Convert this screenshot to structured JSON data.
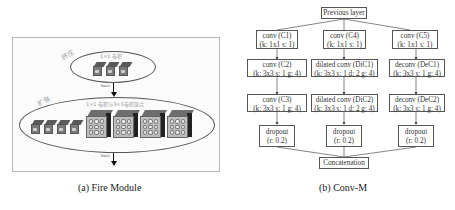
{
  "fire_module": {
    "caption": "(a) Fire Module",
    "squeeze": {
      "label": "挤压",
      "title": "1×1 卷积",
      "output_label": "ReLU",
      "cube_count": 3
    },
    "expand": {
      "label": "扩张",
      "title": "1×1 卷积与3×3卷积混合",
      "output_label": "ReLU",
      "small_cube_count": 4,
      "large_cube_count": 4
    }
  },
  "conv_m": {
    "caption": "(b) Conv-M",
    "input": "Previous layer",
    "columns": [
      {
        "nodes": [
          {
            "name": "conv (C1)",
            "params": "(k: 1x1 s: 1)"
          },
          {
            "name": "conv (C2)",
            "params": "(k: 3x3 s: 1 g: 4)"
          },
          {
            "name": "conv (C3)",
            "params": "(k: 3x3 s: 1 g: 4)"
          },
          {
            "name": "dropout",
            "params": "(r: 0.2)"
          }
        ]
      },
      {
        "nodes": [
          {
            "name": "conv (C4)",
            "params": "(k: 1x1 s: 1)"
          },
          {
            "name": "dilated conv (DiC1)",
            "params": "(k: 3x3 s: 1 d: 2 g: 4)"
          },
          {
            "name": "dilated conv (DiC2)",
            "params": "(k: 3x3 s: 1 d: 2 g: 4)"
          },
          {
            "name": "dropout",
            "params": "(r: 0.2)"
          }
        ]
      },
      {
        "nodes": [
          {
            "name": "conv (C5)",
            "params": "(k: 1x1 s: 1)"
          },
          {
            "name": "deconv (DeC1)",
            "params": "(k: 3x3 s: 1 g: 4)"
          },
          {
            "name": "deconv (DeC2)",
            "params": "(k: 3x3 s: 1 g: 4)"
          },
          {
            "name": "dropout",
            "params": "(r: 0.2)"
          }
        ]
      }
    ],
    "output": "Concatenation"
  }
}
